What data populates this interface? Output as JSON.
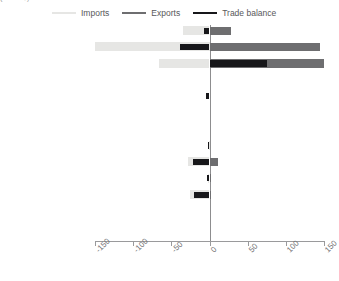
{
  "title_sliver": "(bn US$)",
  "legend": {
    "position": "top",
    "items": [
      {
        "label": "Imports",
        "color": "#e6e6e4",
        "name": "imports"
      },
      {
        "label": "Exports",
        "color": "#6e6e70",
        "name": "exports"
      },
      {
        "label": "Trade balance",
        "color": "#17171a",
        "name": "trade-balance"
      }
    ]
  },
  "axis": {
    "ticks": [
      -150,
      -100,
      -50,
      0,
      50,
      100,
      150
    ],
    "tick_labels": [
      "-150",
      "-100",
      "-50",
      "0",
      "50",
      "100",
      "150"
    ],
    "min": -150,
    "max": 150
  },
  "chart_data": {
    "type": "bar",
    "orientation": "horizontal",
    "title": "(bn US$)",
    "xlabel": "",
    "ylabel": "",
    "xlim": [
      -150,
      150
    ],
    "grid": false,
    "legend_position": "top",
    "categories": [
      "Developed Asia-Pacific",
      "Developed Europe",
      "Developed N. America",
      "South-eastern Europe",
      "C I S",
      "Northern Africa",
      "Sub-Saharan Africa",
      "Latin Am, Caribbean",
      "Eastern Asia",
      "Southern Asia",
      "South-eastern Asia",
      "Western Asia",
      "Oceania"
    ],
    "series": [
      {
        "name": "Imports",
        "color": "#e6e6e4",
        "values": [
          -35,
          -160,
          -66,
          0,
          0,
          0,
          0,
          -1,
          -28,
          -2,
          -25,
          0,
          0
        ]
      },
      {
        "name": "Exports",
        "color": "#6e6e70",
        "values": [
          28,
          145,
          168,
          0,
          0,
          0,
          0,
          0,
          11,
          1,
          2,
          0,
          0
        ]
      },
      {
        "name": "Trade balance",
        "color": "#17171a",
        "values": [
          -7,
          -38,
          75,
          0,
          -5,
          0,
          0,
          -2,
          -22,
          -3,
          -20,
          0,
          0
        ]
      }
    ]
  }
}
